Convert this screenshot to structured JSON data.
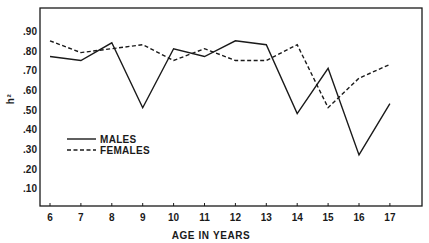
{
  "chart_data": {
    "type": "line",
    "title": "",
    "xlabel": "AGE IN YEARS",
    "ylabel": "h²",
    "x": [
      6,
      7,
      8,
      9,
      10,
      11,
      12,
      13,
      14,
      15,
      16,
      17
    ],
    "x_tick_labels": [
      "6",
      "7",
      "8",
      "9",
      "10",
      "11",
      "12",
      "13",
      "14",
      "15",
      "16",
      "17"
    ],
    "y_tick_values": [
      0.1,
      0.2,
      0.3,
      0.4,
      0.5,
      0.6,
      0.7,
      0.8,
      0.9
    ],
    "y_tick_labels": [
      ".10",
      ".20",
      ".30",
      ".40",
      ".50",
      ".60",
      ".70",
      ".80",
      ".90"
    ],
    "ylim": [
      0,
      1.0
    ],
    "xlim": [
      5.7,
      18.1
    ],
    "grid": false,
    "legend_position": "lower-left (inside)",
    "series": [
      {
        "name": "MALES",
        "style": "solid",
        "values": [
          0.77,
          0.75,
          0.84,
          0.51,
          0.81,
          0.77,
          0.85,
          0.83,
          0.48,
          0.71,
          0.27,
          0.53
        ]
      },
      {
        "name": "FEMALES",
        "style": "dashed",
        "values": [
          0.85,
          0.79,
          0.81,
          0.83,
          0.75,
          0.81,
          0.75,
          0.75,
          0.83,
          0.51,
          0.66,
          0.73
        ]
      }
    ]
  },
  "legend": {
    "items": [
      {
        "label": "MALES",
        "style": "solid"
      },
      {
        "label": "FEMALES",
        "style": "dashed"
      }
    ]
  },
  "colors": {
    "ink": "#1a1a1a",
    "background": "#ffffff"
  }
}
